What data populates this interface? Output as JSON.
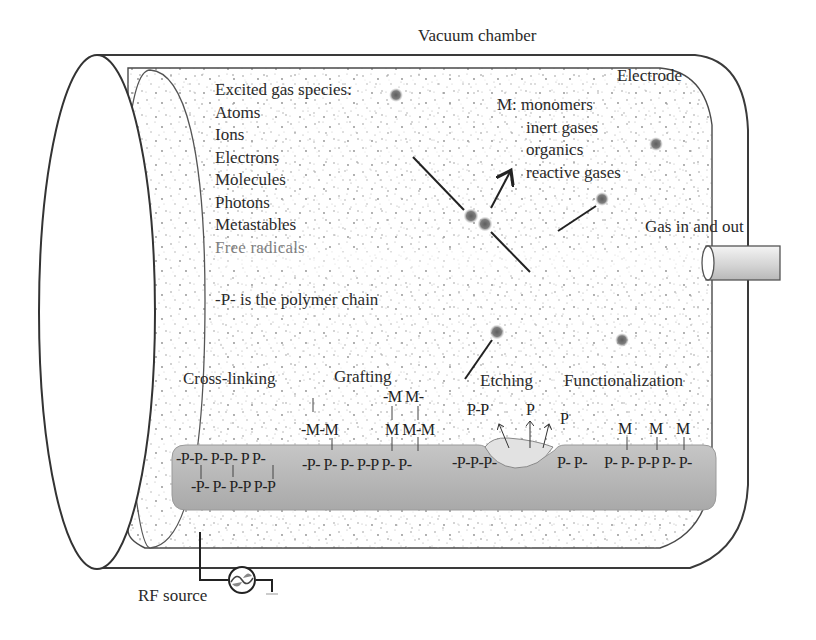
{
  "title": "Vacuum chamber",
  "labels": {
    "electrode": "Electrode",
    "gas_port": "Gas in and out",
    "rf_source": "RF source",
    "polymer_note": "-P- is the polymer chain"
  },
  "excited_species": {
    "heading": "Excited gas species:",
    "items": [
      "Atoms",
      "Ions",
      "Electrons",
      "Molecules",
      "Photons",
      "Metastables",
      "Free radicals"
    ]
  },
  "m_definition": {
    "prefix": "M:",
    "items": [
      "monomers",
      "inert gases",
      "organics",
      "reactive gases"
    ]
  },
  "processes": [
    {
      "name": "Cross-linking",
      "row_top": "-P-P- P-P- P P-",
      "row_bottom": "-P- P- P-P P-P"
    },
    {
      "name": "Grafting",
      "monomer_top": "-M M-",
      "monomer_mid_left": "-M-M",
      "monomer_mid_right": "M M-M",
      "row": "-P- P- P- P-P P- P-"
    },
    {
      "name": "Etching",
      "ejected": [
        "P-P",
        "P",
        "P"
      ],
      "row_left": "-P-P-P-",
      "row_right": "P- P-"
    },
    {
      "name": "Functionalization",
      "monomers": [
        "M",
        "M",
        "M"
      ],
      "row": "P- P- P-P P- P-"
    }
  ],
  "colors": {
    "outline": "#3a3a3a",
    "substrate": "#b5b5b5",
    "speckle": "#8a8a8a",
    "particle": "#6e6e6e"
  }
}
